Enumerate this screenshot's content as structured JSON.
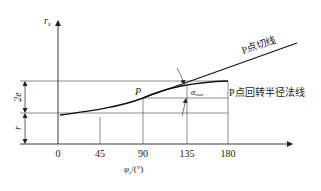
{
  "figure": {
    "y_axis_label": "r",
    "y_axis_label_sub": "x",
    "x_axis_label": "φ",
    "x_axis_label_sub": "x",
    "x_axis_unit": "/(°)",
    "x_ticks": [
      "0",
      "45",
      "90",
      "135",
      "180"
    ],
    "dimension_2e": "2e",
    "dimension_r": "r",
    "point_label": "P",
    "angle_label": "α",
    "angle_label_sub": "max",
    "tangent_label": "P点切线",
    "normal_label": "P点回转半径法线"
  },
  "colors": {
    "line": "#222222",
    "background": "#ffffff"
  }
}
